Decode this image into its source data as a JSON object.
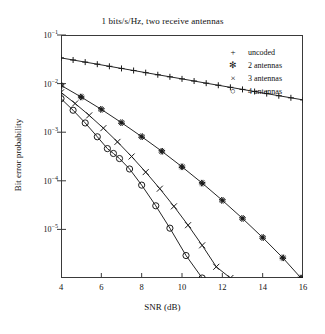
{
  "chart_data": {
    "type": "line",
    "title": "1 bits/s/Hz, two receive antennas",
    "xlabel": "SNR (dB)",
    "ylabel": "Bit error probability",
    "xlim": [
      4,
      16
    ],
    "ylim": [
      1e-06,
      0.1
    ],
    "yscale": "log",
    "grid": false,
    "legend_position": "top-right",
    "xticks": [
      4,
      6,
      8,
      10,
      12,
      14,
      16
    ],
    "xtick_labels": [
      "4",
      "6",
      "8",
      "10",
      "12",
      "14",
      "16"
    ],
    "yticks": [
      0.1,
      0.01,
      0.001,
      0.0001,
      1e-05
    ],
    "ytick_labels": [
      "10-1",
      "10-2",
      "10-3",
      "10-4",
      "10-5"
    ],
    "series": [
      {
        "name": "uncoded",
        "marker": "plus",
        "x": [
          4,
          4.6,
          5.2,
          5.8,
          6.4,
          7,
          7.6,
          8.2,
          8.8,
          9.4,
          10,
          10.6,
          11.2,
          11.8,
          12.4,
          13,
          13.6,
          14.2,
          14.8,
          15.4,
          16
        ],
        "y": [
          0.0338,
          0.0306,
          0.0277,
          0.0251,
          0.0227,
          0.0205,
          0.0186,
          0.0168,
          0.0152,
          0.0138,
          0.0125,
          0.0113,
          0.0102,
          0.00925,
          0.00838,
          0.00759,
          0.00687,
          0.00622,
          0.00563,
          0.0051,
          0.00462
        ]
      },
      {
        "name": "2 antennas",
        "marker": "asterisk",
        "x": [
          4,
          5,
          6,
          7,
          8,
          9,
          10,
          11,
          12,
          13,
          14,
          15,
          15.9
        ],
        "y": [
          0.0092,
          0.0053,
          0.00295,
          0.00157,
          0.00081,
          0.000405,
          0.000194,
          8.95e-05,
          3.96e-05,
          1.68e-05,
          6.8e-06,
          2.6e-06,
          1e-06
        ]
      },
      {
        "name": "3 antennas",
        "marker": "cross",
        "x": [
          4,
          4.7,
          5.4,
          6.1,
          6.8,
          7.5,
          8.2,
          8.9,
          9.6,
          10.3,
          11,
          11.7,
          12.4
        ],
        "y": [
          0.0066,
          0.0039,
          0.00222,
          0.00121,
          0.000632,
          0.000316,
          0.000151,
          6.88e-05,
          2.98e-05,
          1.22e-05,
          4.7e-06,
          1.7e-06,
          1e-06
        ]
      },
      {
        "name": "4 antennas",
        "marker": "circle",
        "x": [
          4,
          4.6,
          5.2,
          5.8,
          6.3,
          6.6,
          6.9,
          7.4,
          8.0,
          8.7,
          9.4,
          10.2,
          11
        ],
        "y": [
          0.0049,
          0.00283,
          0.00155,
          0.000805,
          0.00046,
          0.000365,
          0.000287,
          0.000175,
          8.15e-05,
          3.06e-05,
          1.06e-05,
          2.9e-06,
          1e-06
        ]
      }
    ]
  },
  "legend": {
    "items": [
      {
        "marker": "+",
        "label": "uncoded"
      },
      {
        "marker": "✻",
        "label": "2 antennas"
      },
      {
        "marker": "×",
        "label": "3 antennas"
      },
      {
        "marker": "○",
        "label": "4 antennas"
      }
    ]
  }
}
